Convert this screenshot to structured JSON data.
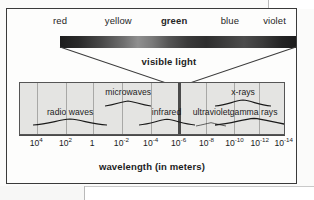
{
  "figure": {
    "type": "electromagnetic-spectrum-diagram",
    "axis_title": "wavelength (in meters)",
    "visible_light_label": "visible light"
  },
  "visible_light": {
    "colors": [
      {
        "label": "red",
        "x_pct": 10.5,
        "bold": false
      },
      {
        "label": "yellow",
        "x_pct": 34.0,
        "bold": false
      },
      {
        "label": "green",
        "x_pct": 56.5,
        "bold": true
      },
      {
        "label": "blue",
        "x_pct": 79.0,
        "bold": false
      },
      {
        "label": "violet",
        "x_pct": 97.0,
        "bold": false
      }
    ]
  },
  "spectrum_bands": [
    {
      "label": "radio waves",
      "x_pct": 19.0,
      "label_y": 24,
      "wave_y": 33,
      "wave_w": 74,
      "wave_scale": 1.0
    },
    {
      "label": "microwaves",
      "x_pct": 41.0,
      "label_y": 4,
      "wave_y": 14,
      "wave_w": 46,
      "wave_scale": 0.85
    },
    {
      "label": "infrared",
      "x_pct": 55.5,
      "label_y": 24,
      "wave_y": 33,
      "wave_w": 56,
      "wave_scale": 0.95
    },
    {
      "label": "ultraviolet",
      "x_pct": 72.5,
      "label_y": 24,
      "wave_y": 34,
      "wave_w": 30,
      "wave_scale": 0.55
    },
    {
      "label": "x-rays",
      "x_pct": 84.5,
      "label_y": 4,
      "wave_y": 14,
      "wave_w": 56,
      "wave_scale": 1.0
    },
    {
      "label": "gamma rays",
      "x_pct": 88.5,
      "label_y": 24,
      "wave_y": 33,
      "wave_w": 78,
      "wave_scale": 1.1
    }
  ],
  "axis": {
    "ticks": [
      {
        "mantissa": "10",
        "exponent": "4",
        "x_pct": 6.5
      },
      {
        "mantissa": "10",
        "exponent": "2",
        "x_pct": 17.5
      },
      {
        "mantissa": "1",
        "exponent": "",
        "x_pct": 27.5
      },
      {
        "mantissa": "10",
        "exponent": "-2",
        "x_pct": 38.5
      },
      {
        "mantissa": "10",
        "exponent": "-4",
        "x_pct": 49.5
      },
      {
        "mantissa": "10",
        "exponent": "-6",
        "x_pct": 60.0
      },
      {
        "mantissa": "10",
        "exponent": "-8",
        "x_pct": 70.5
      },
      {
        "mantissa": "10",
        "exponent": "-10",
        "x_pct": 81.0
      },
      {
        "mantissa": "10",
        "exponent": "-12",
        "x_pct": 90.5
      },
      {
        "mantissa": "10",
        "exponent": "-14",
        "x_pct": 99.5
      }
    ],
    "gridlines_pct": [
      6.5,
      17.5,
      27.5,
      38.5,
      49.5,
      60.0,
      70.5,
      81.0,
      90.5
    ],
    "uv_divider_pct": 60.0
  },
  "chart_data": {
    "type": "bar",
    "xlabel": "wavelength (in meters)",
    "ylabel": "",
    "categories": [
      "radio waves",
      "microwaves",
      "infrared",
      "visible light",
      "ultraviolet",
      "x-rays",
      "gamma rays"
    ],
    "values": [
      1,
      1,
      1,
      1,
      1,
      1,
      1
    ],
    "x": [
      "10^4",
      "10^2",
      "1",
      "10^-2",
      "10^-4",
      "10^-6",
      "10^-8",
      "10^-10",
      "10^-12",
      "10^-14"
    ],
    "xlim": [
      "10^4",
      "10^-14"
    ],
    "grid": true,
    "legend": "none"
  }
}
